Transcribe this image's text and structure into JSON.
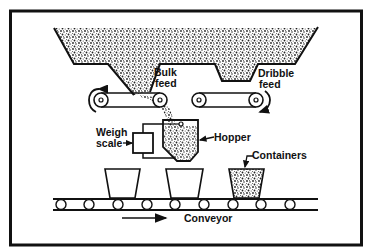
{
  "diagram": {
    "type": "process-schematic",
    "labels": {
      "bulk_feed_line1": "Bulk",
      "bulk_feed_line2": "feed",
      "dribble_feed_line1": "Dribble",
      "dribble_feed_line2": "feed",
      "weigh_scale_line1": "Weigh",
      "weigh_scale_line2": "scale",
      "hopper": "Hopper",
      "containers": "Containers",
      "conveyor": "Conveyor"
    },
    "components": [
      {
        "name": "supply-bin",
        "desc": "Large granular-material bin with two outlets"
      },
      {
        "name": "bulk-feed-outlet",
        "desc": "Left funnel outlet onto belt"
      },
      {
        "name": "dribble-feed-outlet",
        "desc": "Right shallow outlet onto belt"
      },
      {
        "name": "bulk-feed-belt",
        "desc": "Left belt conveyor, counter-clockwise rotation arrow"
      },
      {
        "name": "dribble-feed-belt",
        "desc": "Right belt conveyor, clockwise rotation arrow"
      },
      {
        "name": "weigh-scale",
        "desc": "Box connected to hopper"
      },
      {
        "name": "weigh-hopper",
        "desc": "Hopper receiving material"
      },
      {
        "name": "containers",
        "count": 3,
        "filled": [
          false,
          false,
          true
        ]
      },
      {
        "name": "roller-conveyor",
        "rollers": 9,
        "direction": "right"
      }
    ],
    "colors": {
      "ink": "#111111",
      "background": "#ffffff",
      "material": "#555555"
    }
  }
}
